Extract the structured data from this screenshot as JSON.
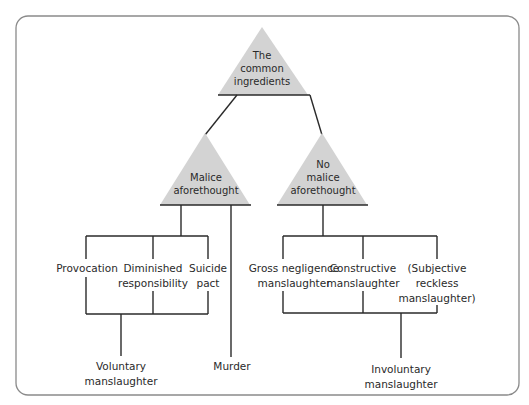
{
  "diagram": {
    "title_node": {
      "lines": [
        "The",
        "common",
        "ingredients"
      ]
    },
    "malice_node": {
      "lines": [
        "Malice",
        "aforethought"
      ]
    },
    "no_malice_node": {
      "lines": [
        "No",
        "malice",
        "aforethought"
      ]
    },
    "voluntary_defences": [
      {
        "lines": [
          "Provocation"
        ]
      },
      {
        "lines": [
          "Diminished",
          "responsibility"
        ]
      },
      {
        "lines": [
          "Suicide",
          "pact"
        ]
      }
    ],
    "involuntary_types": [
      {
        "lines": [
          "Gross negligence",
          "manslaughter"
        ]
      },
      {
        "lines": [
          "Constructive",
          "manslaughter"
        ]
      },
      {
        "lines": [
          "(Subjective",
          "reckless",
          "manslaughter)"
        ]
      }
    ],
    "outcomes": {
      "voluntary": {
        "lines": [
          "Voluntary",
          "manslaughter"
        ]
      },
      "murder": {
        "lines": [
          "Murder"
        ]
      },
      "involuntary": {
        "lines": [
          "Involuntary",
          "manslaughter"
        ]
      }
    },
    "colors": {
      "triangle_fill": "#d3d3d3",
      "line": "#2a2a2a",
      "frame": "#8a8a8a",
      "text": "#2a2a2a"
    }
  }
}
